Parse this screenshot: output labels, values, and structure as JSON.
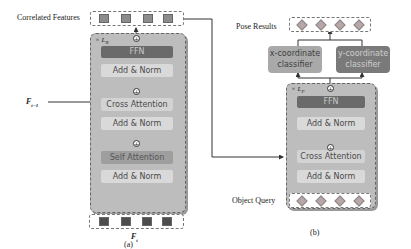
{
  "panel_a": {
    "caption": "(a)",
    "top_label": "Correlated Features",
    "repeat_label": "× L",
    "repeat_sub": "R",
    "side_input_label": "F",
    "side_input_sub": "t−1",
    "bottom_label": "F",
    "bottom_sub": "t",
    "blocks": {
      "ffn": "FFN",
      "add_norm_1": "Add & Norm",
      "cross_attention": "Cross Attention",
      "add_norm_2": "Add & Norm",
      "self_attention": "Self Attention",
      "add_norm_3": "Add & Norm"
    },
    "top_tokens": 4,
    "bottom_tokens": 4
  },
  "panel_b": {
    "caption": "(b)",
    "top_label": "Pose Results",
    "bottom_label": "Object Query",
    "repeat_label": "× L",
    "repeat_sub": "P",
    "x_classifier": "x-coordinate classifier",
    "x_classifier_l1": "x-coordinate",
    "x_classifier_l2": "classifier",
    "y_classifier_l1": "y-coordinate",
    "y_classifier_l2": "classifier",
    "blocks": {
      "ffn": "FFN",
      "add_norm_1": "Add & Norm",
      "cross_attention": "Cross Attention",
      "add_norm_2": "Add & Norm"
    }
  },
  "colors": {
    "stack_bg": "#bdbdbd",
    "ffn": "#6a6a6a",
    "add_norm": "#d9d9d9",
    "self_attention": "#9e9e9e",
    "x_classifier": "#a9a9a9",
    "y_classifier": "#7a7a7a",
    "top_token": "#8c8c8c",
    "bottom_token": "#4d4d4d",
    "diamond": "#b9a6a6"
  }
}
